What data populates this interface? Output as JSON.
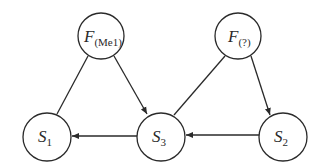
{
  "diagram": {
    "type": "directed-graph",
    "nodes": [
      {
        "id": "FMe1",
        "main": "F",
        "sub": "(Me1)"
      },
      {
        "id": "Fq",
        "main": "F",
        "sub": "(?)"
      },
      {
        "id": "S1",
        "main": "S",
        "sub": "1"
      },
      {
        "id": "S3",
        "main": "S",
        "sub": "3"
      },
      {
        "id": "S2",
        "main": "S",
        "sub": "2"
      }
    ],
    "edges": [
      {
        "from": "FMe1",
        "to": "S1",
        "directed": false
      },
      {
        "from": "FMe1",
        "to": "S3",
        "directed": true
      },
      {
        "from": "Fq",
        "to": "S3",
        "directed": false
      },
      {
        "from": "Fq",
        "to": "S2",
        "directed": true
      },
      {
        "from": "S3",
        "to": "S1",
        "directed": true
      },
      {
        "from": "S2",
        "to": "S3",
        "directed": true
      }
    ]
  }
}
